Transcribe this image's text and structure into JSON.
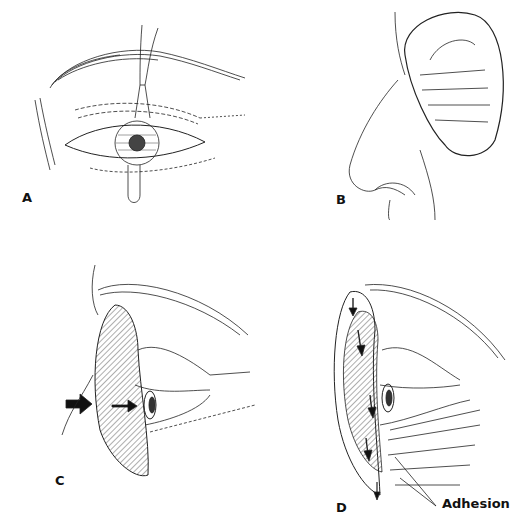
{
  "figure": {
    "panels": [
      {
        "id": "A",
        "label": "A",
        "description": "frontal eye with sutured lid and traction suture"
      },
      {
        "id": "B",
        "label": "B",
        "description": "profile of nose with pressure dressing over eye"
      },
      {
        "id": "C",
        "label": "C",
        "description": "lateral eye with shaded shield and arrows"
      },
      {
        "id": "D",
        "label": "D",
        "description": "lateral eye with shield, downward arrows and adhesion"
      }
    ],
    "annotations": {
      "adhesion": "Adhesion"
    },
    "colors": {
      "ink": "#111111",
      "background": "#ffffff"
    }
  }
}
